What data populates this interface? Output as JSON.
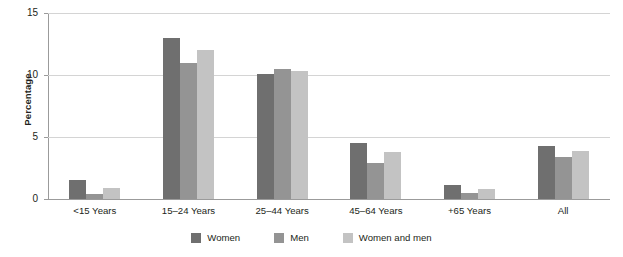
{
  "chart_data": {
    "type": "bar",
    "title": "",
    "subtitle": "",
    "xlabel": "",
    "ylabel": "Percentage",
    "ylim": [
      0,
      15
    ],
    "yticks": [
      0,
      5,
      10,
      15
    ],
    "ytick_labels": [
      "0",
      "5",
      "10",
      "15"
    ],
    "grid": "horizontal",
    "legend_position": "bottom-center",
    "categories": [
      "<15 Years",
      "15–24 Years",
      "25–44 Years",
      "45–64 Years",
      "+65 Years",
      "All"
    ],
    "series": [
      {
        "name": "Women",
        "color": "#6f6f6f",
        "values": [
          1.5,
          13.0,
          10.1,
          4.5,
          1.1,
          4.3
        ]
      },
      {
        "name": "Men",
        "color": "#949494",
        "values": [
          0.4,
          11.0,
          10.5,
          2.9,
          0.5,
          3.4
        ]
      },
      {
        "name": "Women and men",
        "color": "#c3c3c3",
        "values": [
          0.9,
          12.0,
          10.3,
          3.8,
          0.8,
          3.9
        ]
      }
    ]
  },
  "axis": {
    "y_title": "Percentage"
  },
  "colors": {
    "gridline": "#d4d4d4",
    "axis": "#9b9b9b",
    "text": "#231f20",
    "background": "#ffffff"
  }
}
